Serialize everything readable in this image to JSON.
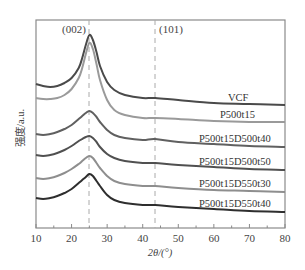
{
  "chart_data": {
    "type": "line",
    "title": "",
    "xlabel": "2θ/(°)",
    "ylabel": "强度/a.u.",
    "xlim": [
      10,
      80
    ],
    "xticks": [
      10,
      20,
      30,
      40,
      50,
      60,
      70,
      80
    ],
    "xticks_minor": [
      15,
      25,
      35,
      45,
      55,
      65,
      75
    ],
    "yticks": [],
    "grid": false,
    "legend_position": "inline-right",
    "reference_lines": [
      {
        "x": 25,
        "label": "(002)",
        "style": "dashed"
      },
      {
        "x": 43.5,
        "label": "(101)",
        "style": "dashed"
      }
    ],
    "series": [
      {
        "name": "VCF",
        "color": "#4a4a4a",
        "x": [
          10,
          12,
          14,
          16,
          18,
          20,
          22,
          23,
          24,
          25,
          26,
          27,
          28,
          30,
          32,
          35,
          40,
          43.5,
          50,
          60,
          70,
          80
        ],
        "y_px": [
          84,
          86,
          87,
          86,
          83,
          78,
          68,
          58,
          45,
          35,
          40,
          52,
          66,
          82,
          90,
          95,
          98,
          98,
          100,
          103,
          104,
          105
        ]
      },
      {
        "name": "P500t15",
        "color": "#9a9a9a",
        "x": [
          10,
          12,
          14,
          16,
          18,
          20,
          22,
          23,
          24,
          25,
          26,
          27,
          28,
          30,
          32,
          35,
          40,
          43.5,
          50,
          60,
          70,
          80
        ],
        "y_px": [
          98,
          99,
          99,
          98,
          95,
          89,
          78,
          68,
          54,
          43,
          49,
          64,
          80,
          100,
          110,
          115,
          118,
          118,
          119,
          121,
          122,
          122
        ]
      },
      {
        "name": "P500t15D500t40",
        "color": "#606060",
        "x": [
          10,
          12,
          14,
          16,
          18,
          20,
          22,
          23,
          24,
          25,
          26,
          27,
          28,
          30,
          32,
          35,
          40,
          43.5,
          50,
          60,
          70,
          80
        ],
        "y_px": [
          134,
          135,
          134,
          132,
          129,
          125,
          119,
          116,
          113,
          111,
          113,
          117,
          122,
          130,
          135,
          138,
          140,
          139,
          142,
          144,
          146,
          147
        ]
      },
      {
        "name": "P500t15D500t50",
        "color": "#505050",
        "x": [
          10,
          12,
          14,
          16,
          18,
          20,
          22,
          23,
          24,
          25,
          26,
          27,
          28,
          30,
          32,
          35,
          40,
          43.5,
          50,
          60,
          70,
          80
        ],
        "y_px": [
          155,
          156,
          155,
          153,
          150,
          146,
          141,
          139,
          137,
          136,
          138,
          142,
          147,
          154,
          158,
          161,
          163,
          163,
          165,
          167,
          169,
          170
        ]
      },
      {
        "name": "P500t15D550t30",
        "color": "#8e8e8e",
        "x": [
          10,
          12,
          14,
          16,
          18,
          20,
          22,
          23,
          24,
          25,
          26,
          27,
          28,
          30,
          32,
          35,
          40,
          43.5,
          50,
          60,
          70,
          80
        ],
        "y_px": [
          178,
          179,
          178,
          176,
          173,
          169,
          164,
          161,
          158,
          156,
          158,
          163,
          168,
          176,
          181,
          184,
          186,
          186,
          188,
          190,
          191,
          192
        ]
      },
      {
        "name": "P500t15D550t40",
        "color": "#2e2e2e",
        "x": [
          10,
          12,
          14,
          16,
          18,
          20,
          22,
          23,
          24,
          25,
          26,
          27,
          28,
          30,
          32,
          35,
          40,
          43.5,
          50,
          60,
          70,
          80
        ],
        "y_px": [
          198,
          199,
          198,
          196,
          193,
          189,
          183,
          180,
          177,
          174,
          176,
          181,
          186,
          195,
          200,
          203,
          205,
          205,
          207,
          209,
          211,
          212
        ]
      }
    ]
  },
  "labels": {
    "peak_002": "(002)",
    "peak_101": "(101)",
    "xlabel": "2θ/(°)",
    "ylabel": "强度/a.u.",
    "series": [
      "VCF",
      "P500t15",
      "P500t15D500t40",
      "P500t15D500t50",
      "P500t15D550t30",
      "P500t15D550t40"
    ],
    "xticks": [
      "10",
      "20",
      "30",
      "40",
      "50",
      "60",
      "70",
      "80"
    ]
  }
}
